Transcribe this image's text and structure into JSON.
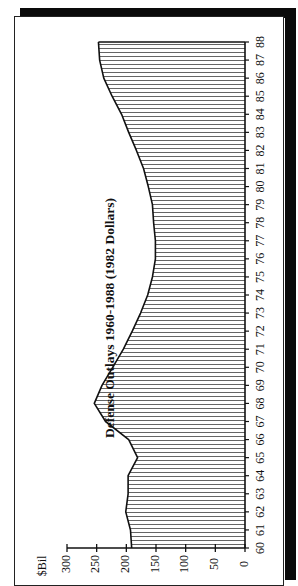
{
  "chart_data": {
    "type": "area",
    "title": "Defense Outlays 1960-1988 (1982 Dollars)",
    "xlabel": "",
    "ylabel": "$Bil",
    "orientation": "rotated 90 degrees counter-clockwise",
    "fill_pattern": "vertical hatching",
    "categories": [
      "60",
      "61",
      "62",
      "63",
      "64",
      "65",
      "66",
      "67",
      "68",
      "69",
      "70",
      "71",
      "72",
      "73",
      "74",
      "75",
      "76",
      "77",
      "78",
      "79",
      "80",
      "81",
      "82",
      "83",
      "84",
      "85",
      "86",
      "87",
      "88"
    ],
    "series": [
      {
        "name": "Defense Outlays",
        "values": [
          191,
          193,
          201,
          197,
          197,
          181,
          196,
          235,
          254,
          241,
          223,
          205,
          190,
          176,
          164,
          156,
          151,
          151,
          154,
          156,
          163,
          171,
          183,
          196,
          208,
          224,
          238,
          245,
          247
        ]
      }
    ],
    "yticks": [
      "0",
      "50",
      "100",
      "150",
      "200",
      "250",
      "300"
    ],
    "ylim": [
      0,
      300
    ],
    "grid": false,
    "legend": null
  },
  "labels": {
    "title": "Defense Outlays 1960-1988 (1982 Dollars)",
    "unit": "$Bil"
  }
}
